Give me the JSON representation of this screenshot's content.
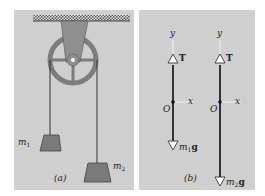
{
  "figure": {
    "panel_a": {
      "caption": "(a)",
      "mass_1_label": "m",
      "mass_1_sub": "1",
      "mass_2_label": "m",
      "mass_2_sub": "2",
      "elements": [
        "ceiling-support",
        "pulley-bracket",
        "pulley-wheel",
        "rope-left",
        "rope-right",
        "mass-1",
        "mass-2"
      ]
    },
    "panel_b": {
      "caption": "(b)",
      "diagram_1": {
        "y_axis_label": "y",
        "x_axis_label": "x",
        "origin_label": "O",
        "tension_label": "T",
        "weight_label_m": "m",
        "weight_label_sub": "1",
        "weight_label_g": "g"
      },
      "diagram_2": {
        "y_axis_label": "y",
        "x_axis_label": "x",
        "origin_label": "O",
        "tension_label": "T",
        "weight_label_m": "m",
        "weight_label_sub": "2",
        "weight_label_g": "g"
      }
    },
    "colors": {
      "panel_bg": "#cfcfcf",
      "pulley": "#8a8a8a",
      "mass": "#7a7a7a",
      "rope": "#333333",
      "vector": "#222222"
    }
  }
}
